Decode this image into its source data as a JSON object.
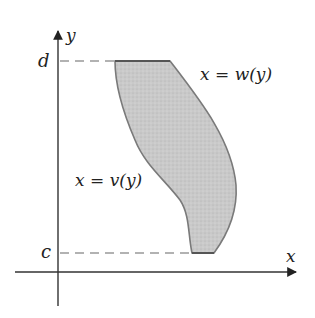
{
  "figure": {
    "type": "region-between-curves",
    "axes": {
      "x_label": "x",
      "y_label": "y"
    },
    "bounds": {
      "upper_label": "d",
      "lower_label": "c"
    },
    "curves": {
      "left": {
        "label": "x = v(y)"
      },
      "right": {
        "label": "x = w(y)"
      }
    },
    "colors": {
      "region_fill": "#c8c8c8",
      "region_edge": "#7a7a7a",
      "axis": "#333333",
      "dashed": "#999999"
    }
  }
}
